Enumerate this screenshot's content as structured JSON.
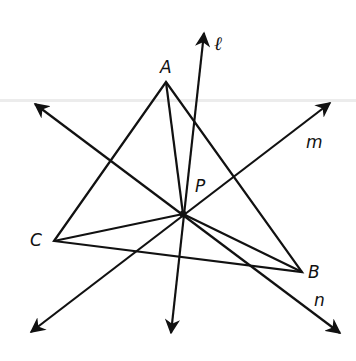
{
  "diagram": {
    "type": "geometry",
    "colors": {
      "stroke": "#111111",
      "background": "#ffffff",
      "ghost_line": "#ececec"
    },
    "points": {
      "A": {
        "label": "A",
        "x": 166,
        "y": 82,
        "label_x": 160,
        "label_y": 73
      },
      "B": {
        "label": "B",
        "x": 302,
        "y": 272,
        "label_x": 308,
        "label_y": 278
      },
      "C": {
        "label": "C",
        "x": 54,
        "y": 241,
        "label_x": 30,
        "label_y": 246
      },
      "P": {
        "label": "P",
        "x": 183,
        "y": 214,
        "label_x": 195,
        "label_y": 192
      }
    },
    "triangle": [
      "A",
      "B",
      "C"
    ],
    "segments_from_P": [
      "A",
      "B",
      "C"
    ],
    "lines": [
      {
        "name": "l",
        "label": "ℓ",
        "x1": 204,
        "y1": 33,
        "x2": 171,
        "y2": 333,
        "label_x": 214,
        "label_y": 50
      },
      {
        "name": "m",
        "label": "m",
        "x1": 31,
        "y1": 332,
        "x2": 330,
        "y2": 103,
        "label_x": 306,
        "label_y": 148
      },
      {
        "name": "n",
        "label": "n",
        "x1": 35,
        "y1": 104,
        "x2": 340,
        "y2": 333,
        "label_x": 314,
        "label_y": 306
      }
    ]
  }
}
